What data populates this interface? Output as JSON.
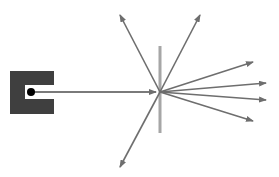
{
  "diagram": {
    "title": "",
    "colors": {
      "source_box": "#3f3f3f",
      "particle": "#000000",
      "beam": "#7a7a7a",
      "foil": "#a6a6a6",
      "arrows": "#6e6e6e",
      "background": "#ffffff"
    },
    "source": {
      "x": 10,
      "y": 71,
      "width": 44,
      "height": 43,
      "slot": {
        "x": 25,
        "y": 85,
        "width": 29,
        "height": 14
      }
    },
    "particle": {
      "cx": 31,
      "cy": 92,
      "r": 4
    },
    "impact_point": {
      "x": 160,
      "y": 92
    },
    "foil": {
      "x": 158.5,
      "y": 46,
      "width": 3,
      "height": 87
    },
    "scattered_arrows": [
      {
        "name": "up-left",
        "x": 120,
        "y": 15
      },
      {
        "name": "up-right",
        "x": 200,
        "y": 15
      },
      {
        "name": "right-upper",
        "x": 253,
        "y": 62
      },
      {
        "name": "right-mid-upper",
        "x": 266,
        "y": 83
      },
      {
        "name": "right-mid-lower",
        "x": 266,
        "y": 100
      },
      {
        "name": "right-lower",
        "x": 253,
        "y": 121
      },
      {
        "name": "down-left",
        "x": 120,
        "y": 167
      }
    ]
  }
}
